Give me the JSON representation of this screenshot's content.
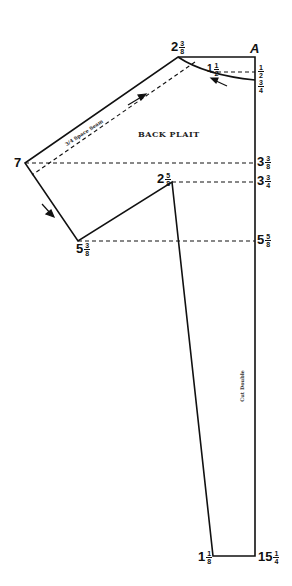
{
  "diagram": {
    "title": "BACK PLAIT",
    "seam_note": "3/4 Space Seam",
    "fold_note": "Cut Double",
    "corner_label": "A",
    "labels": {
      "top_peak": {
        "whole": "2",
        "num": "3",
        "den": "8"
      },
      "curve_mid": {
        "whole": "1",
        "num": "1",
        "den": "2"
      },
      "right_upper_a": {
        "whole": "",
        "num": "1",
        "den": "2"
      },
      "right_upper_b": {
        "whole": "",
        "num": "3",
        "den": "4"
      },
      "left_point": {
        "whole": "7"
      },
      "right_3_3_8": {
        "whole": "3",
        "num": "3",
        "den": "8"
      },
      "inner_point": {
        "whole": "2",
        "num": "5",
        "den": "8"
      },
      "right_3_3_4": {
        "whole": "3",
        "num": "3",
        "den": "4"
      },
      "lower_left": {
        "whole": "5",
        "num": "3",
        "den": "8"
      },
      "right_5_5_8": {
        "whole": "5",
        "num": "5",
        "den": "8"
      },
      "bottom_left": {
        "whole": "1",
        "num": "1",
        "den": "8"
      },
      "bottom_right": {
        "whole": "15",
        "num": "1",
        "den": "4"
      }
    },
    "line_color": "#111111"
  }
}
